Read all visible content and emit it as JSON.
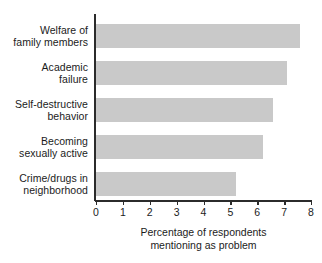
{
  "chart_data": {
    "type": "bar",
    "orientation": "horizontal",
    "title": "",
    "subtitle": "",
    "xlabel_lines": [
      "Percentage of respondents",
      "mentioning as problem"
    ],
    "ylabel": "",
    "xlim": [
      0,
      8
    ],
    "x_ticks": [
      "0",
      "1",
      "2",
      "3",
      "4",
      "5",
      "6",
      "7",
      "8"
    ],
    "grid": false,
    "legend": null,
    "bar_color": "#c9c9c9",
    "axis_color": "#2b2b2b",
    "text_color": "#1b1b1b",
    "categories": [
      "Welfare of family members",
      "Academic failure",
      "Self-destructive behavior",
      "Becoming sexually active",
      "Crime/drugs in neighborhood"
    ],
    "category_label_lines": [
      [
        "Welfare of",
        "family members"
      ],
      [
        "Academic",
        "failure"
      ],
      [
        "Self-destructive",
        "behavior"
      ],
      [
        "Becoming",
        "sexually active"
      ],
      [
        "Crime/drugs in",
        "neighborhood"
      ]
    ],
    "values": [
      7.6,
      7.1,
      6.6,
      6.2,
      5.2
    ]
  }
}
